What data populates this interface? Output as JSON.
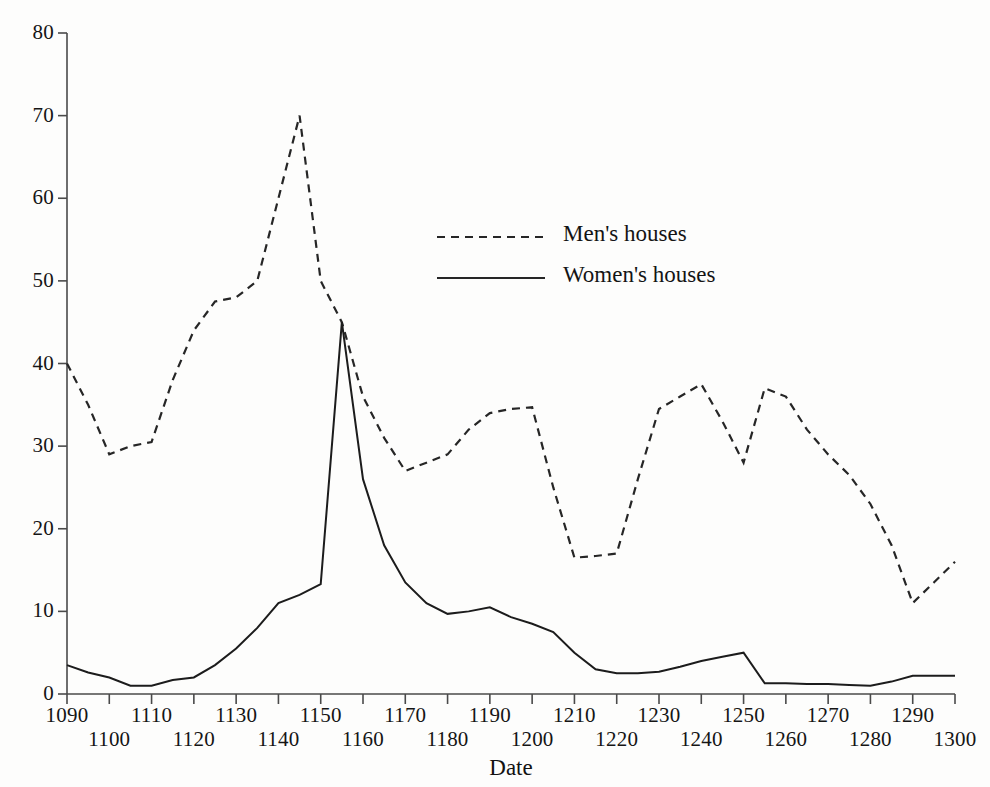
{
  "chart_data": {
    "type": "line",
    "title": "",
    "xlabel": "Date",
    "ylabel": "",
    "xlim": [
      1090,
      1300
    ],
    "ylim": [
      0,
      80
    ],
    "grid": false,
    "legend_position": "upper-center",
    "x_tick_step": 10,
    "y_tick_step": 10,
    "x": [
      1090,
      1095,
      1100,
      1105,
      1110,
      1115,
      1120,
      1125,
      1130,
      1135,
      1140,
      1145,
      1150,
      1155,
      1160,
      1165,
      1170,
      1175,
      1180,
      1185,
      1190,
      1195,
      1200,
      1205,
      1210,
      1215,
      1220,
      1225,
      1230,
      1235,
      1240,
      1245,
      1250,
      1255,
      1260,
      1265,
      1270,
      1275,
      1280,
      1285,
      1290,
      1295,
      1300
    ],
    "xticks": [
      1090,
      1100,
      1110,
      1120,
      1130,
      1140,
      1150,
      1160,
      1170,
      1180,
      1190,
      1200,
      1210,
      1220,
      1230,
      1240,
      1250,
      1260,
      1270,
      1280,
      1290,
      1300
    ],
    "yticks": [
      0,
      10,
      20,
      30,
      40,
      50,
      60,
      70,
      80
    ],
    "ytick_labels": [
      "0",
      "10",
      "20",
      "30",
      "40",
      "50",
      "60",
      "70",
      "80"
    ],
    "xtick_labels_top": [
      "1090",
      "1110",
      "1130",
      "1150",
      "1170",
      "1190",
      "1210",
      "1230",
      "1250",
      "1270",
      "1290"
    ],
    "xtick_labels_bottom": [
      "1100",
      "1120",
      "1140",
      "1160",
      "1180",
      "1200",
      "1220",
      "1240",
      "1260",
      "1280",
      "1300"
    ],
    "series": [
      {
        "name": "Men's houses",
        "style": "dashed",
        "color": "#262626",
        "values": [
          40,
          35,
          29,
          30,
          30.5,
          38,
          44,
          47.5,
          48,
          50,
          60,
          70,
          50,
          45,
          36,
          31,
          27,
          28,
          29,
          32,
          34,
          34.5,
          34.7,
          25,
          16.5,
          16.7,
          17,
          26,
          34.5,
          36,
          37.5,
          33,
          28,
          37,
          36,
          32,
          29,
          26.5,
          23,
          18,
          11,
          13.5,
          16
        ]
      },
      {
        "name": "Women's houses",
        "style": "solid",
        "color": "#1c1c1c",
        "values": [
          3.5,
          2.6,
          2,
          1,
          1,
          1.7,
          2,
          3.5,
          5.5,
          8,
          11,
          12,
          13.3,
          45,
          26,
          18,
          13.5,
          11,
          9.7,
          10,
          10.5,
          9.3,
          8.5,
          7.5,
          5,
          3,
          2.5,
          2.5,
          2.7,
          3.3,
          4,
          4.5,
          5,
          1.3,
          1.3,
          1.2,
          1.2,
          1.1,
          1,
          1.5,
          2.2,
          2.2,
          2.2
        ]
      }
    ]
  },
  "legend": {
    "items": [
      {
        "label": "Men's houses",
        "style": "dashed"
      },
      {
        "label": "Women's houses",
        "style": "solid"
      }
    ]
  },
  "axis": {
    "x_title": "Date"
  }
}
